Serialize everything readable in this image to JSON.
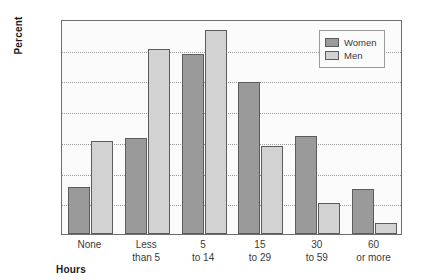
{
  "chart_data": {
    "type": "bar",
    "title": "",
    "xlabel": "Hours",
    "ylabel": "Percent",
    "categories": [
      [
        "None"
      ],
      [
        "Less",
        "than 5"
      ],
      [
        "5",
        "to 14"
      ],
      [
        "15",
        "to 29"
      ],
      [
        "30",
        "to 59"
      ],
      [
        "60",
        "or more"
      ]
    ],
    "series": [
      {
        "name": "Women",
        "color": "#9a9a9a",
        "values": [
          7.7,
          15.6,
          29.3,
          24.7,
          15.9,
          7.3
        ]
      },
      {
        "name": "Men",
        "color": "#d2d2d2",
        "values": [
          15.1,
          30.2,
          33.2,
          14.4,
          5.1,
          1.8
        ]
      }
    ],
    "ylim": [
      0,
      35
    ],
    "yticks": [
      0,
      5,
      10,
      15,
      20,
      25,
      30,
      35
    ],
    "grid": true,
    "legend_position": "top-right"
  }
}
